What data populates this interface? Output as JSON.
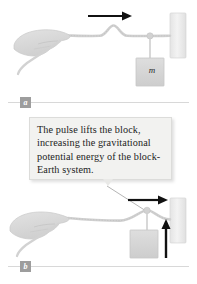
{
  "figure": {
    "background_color": "#ffffff",
    "rope_color": "#d2d2d2",
    "hand_color": "#d9d9d9",
    "block_color": "#d6d6d6",
    "wall_color": "#ededed",
    "arrow_color": "#111111",
    "callout_bg": "#f2f2f0",
    "rule_color": "#d8d8d8",
    "chip_color": "#9d9d9d"
  },
  "callout": {
    "text": "The pulse lifts the block, increasing the gravitational potential energy of the block-Earth system.",
    "line1": "The pulse lifts the block,",
    "line2": "increasing the gravitational",
    "line3": "potential energy of the",
    "line4": "block-Earth system."
  },
  "panels": [
    {
      "id": "a",
      "label": "a",
      "mass_label": "m",
      "pulse_position": "midway along rope, travelling right",
      "block_state": "at rest, hanging from rope",
      "arrows": [
        {
          "name": "pulse-direction-arrow",
          "direction": "right",
          "color": "#111111"
        }
      ]
    },
    {
      "id": "b",
      "label": "b",
      "mass_label": "m",
      "pulse_position": "arrived at the block attachment point",
      "block_state": "being lifted upward",
      "arrows": [
        {
          "name": "pulse-direction-arrow",
          "direction": "right",
          "color": "#111111"
        },
        {
          "name": "block-lift-arrow",
          "direction": "up",
          "color": "#111111"
        }
      ]
    }
  ]
}
